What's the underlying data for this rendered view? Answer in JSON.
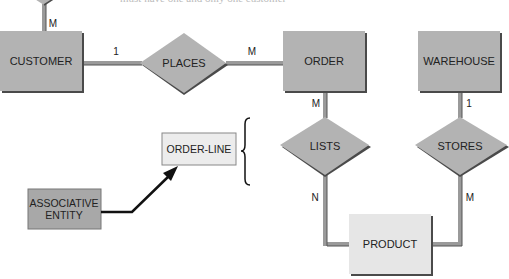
{
  "caption": "must have one and only one customer",
  "entities": {
    "customer": {
      "label": "CUSTOMER"
    },
    "order": {
      "label": "ORDER"
    },
    "warehouse": {
      "label": "WAREHOUSE"
    },
    "product": {
      "label": "PRODUCT"
    },
    "order_line": {
      "label": "ORDER-LINE"
    }
  },
  "relationships": {
    "places": {
      "label": "PLACES"
    },
    "lists": {
      "label": "LISTS"
    },
    "stores": {
      "label": "STORES"
    }
  },
  "cardinalities": {
    "top_customer": "M",
    "customer_places": "1",
    "places_order": "M",
    "order_lists": "M",
    "lists_product": "N",
    "warehouse_stores": "1",
    "stores_product": "M"
  },
  "legend": {
    "associative_entity": "ASSOCIATIVE ENTITY"
  },
  "colors": {
    "entity_fill": "#b3b3b3",
    "entity_shadow": "#4a4a4a",
    "light_entity_fill": "#e6e6e6",
    "connector": "#9a9a9a",
    "connector_dark": "#555555",
    "arrow": "#111111"
  }
}
